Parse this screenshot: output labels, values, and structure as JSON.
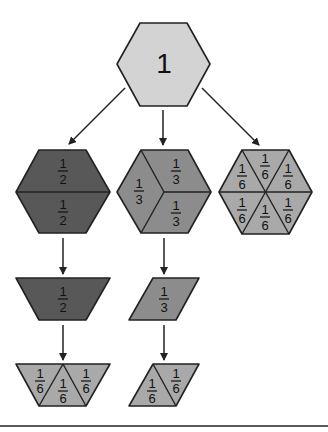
{
  "diagram": {
    "colors": {
      "whole": "#d3d3d3",
      "halves": "#585858",
      "thirds": "#8c8c8c",
      "sixths": "#a9a9a9",
      "stroke": "#222222",
      "baseline": "#222222"
    },
    "root": {
      "label": "1",
      "shape": "hexagon"
    },
    "branches": [
      {
        "name": "halves",
        "hexagon_parts": [
          {
            "num": "1",
            "den": "2"
          },
          {
            "num": "1",
            "den": "2"
          }
        ],
        "single_piece": {
          "shape": "trapezoid",
          "num": "1",
          "den": "2"
        },
        "decomposed": [
          {
            "num": "1",
            "den": "6"
          },
          {
            "num": "1",
            "den": "6"
          },
          {
            "num": "1",
            "den": "6"
          }
        ]
      },
      {
        "name": "thirds",
        "hexagon_parts": [
          {
            "num": "1",
            "den": "3"
          },
          {
            "num": "1",
            "den": "3"
          },
          {
            "num": "1",
            "den": "3"
          }
        ],
        "single_piece": {
          "shape": "rhombus",
          "num": "1",
          "den": "3"
        },
        "decomposed": [
          {
            "num": "1",
            "den": "6"
          },
          {
            "num": "1",
            "den": "6"
          }
        ]
      },
      {
        "name": "sixths",
        "hexagon_parts": [
          {
            "num": "1",
            "den": "6"
          },
          {
            "num": "1",
            "den": "6"
          },
          {
            "num": "1",
            "den": "6"
          },
          {
            "num": "1",
            "den": "6"
          },
          {
            "num": "1",
            "den": "6"
          },
          {
            "num": "1",
            "den": "6"
          }
        ]
      }
    ]
  }
}
